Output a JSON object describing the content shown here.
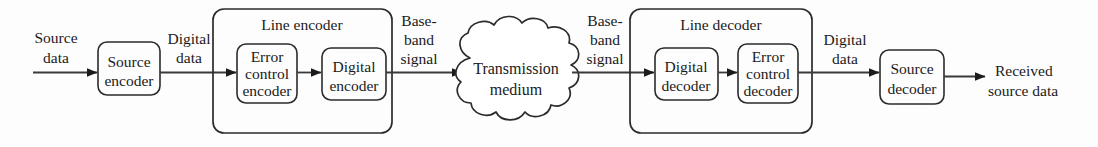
{
  "diagram": {
    "colors": {
      "background": "#fdfdfd",
      "stroke": "#2b2b2b",
      "connector": "#3a3a3a",
      "text": "#1a1a1a"
    },
    "blocks": {
      "source_encoder": {
        "line1": "Source",
        "line2": "encoder"
      },
      "line_encoder": {
        "title": "Line encoder"
      },
      "error_control_encoder": {
        "line1": "Error",
        "line2": "control",
        "line3": "encoder"
      },
      "digital_encoder": {
        "line1": "Digital",
        "line2": "encoder"
      },
      "transmission_medium": {
        "line1": "Transmission",
        "line2": "medium"
      },
      "line_decoder": {
        "title": "Line decoder"
      },
      "digital_decoder": {
        "line1": "Digital",
        "line2": "decoder"
      },
      "error_control_decoder": {
        "line1": "Error",
        "line2": "control",
        "line3": "decoder"
      },
      "source_decoder": {
        "line1": "Source",
        "line2": "decoder"
      }
    },
    "signals": {
      "source_data": {
        "line1": "Source",
        "line2": "data"
      },
      "digital_data_tx": {
        "line1": "Digital",
        "line2": "data"
      },
      "baseband_tx": {
        "line1": "Base-",
        "line2": "band",
        "line3": "signal"
      },
      "baseband_rx": {
        "line1": "Base-",
        "line2": "band",
        "line3": "signal"
      },
      "digital_data_rx": {
        "line1": "Digital",
        "line2": "data"
      },
      "received_source_data": {
        "line1": "Received",
        "line2": "source data"
      }
    }
  }
}
